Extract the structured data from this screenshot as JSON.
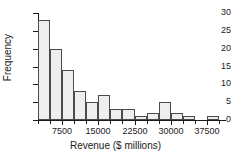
{
  "chart_data": {
    "type": "bar",
    "title": "",
    "xlabel": "Revenue ($ millions)",
    "ylabel": "Frequency",
    "grid": false,
    "legend": null,
    "xlim": [
      2500,
      41250
    ],
    "ylim": [
      0,
      30
    ],
    "bin_width": 2500,
    "xticks": [
      7500,
      15000,
      22500,
      30000,
      37500
    ],
    "xtick_labels": [
      "7500",
      "15000",
      "22500",
      "30000",
      "37500"
    ],
    "yticks": [
      0,
      5,
      10,
      15,
      20,
      25,
      30
    ],
    "ytick_labels": [
      "0",
      "5",
      "10",
      "15",
      "20",
      "25",
      "30"
    ],
    "bins": [
      {
        "left": 2500,
        "right": 5000,
        "center": 3750,
        "value": 28
      },
      {
        "left": 5000,
        "right": 7500,
        "center": 6250,
        "value": 20
      },
      {
        "left": 7500,
        "right": 10000,
        "center": 8750,
        "value": 14
      },
      {
        "left": 10000,
        "right": 12500,
        "center": 11250,
        "value": 8
      },
      {
        "left": 12500,
        "right": 15000,
        "center": 13750,
        "value": 5
      },
      {
        "left": 15000,
        "right": 17500,
        "center": 16250,
        "value": 7
      },
      {
        "left": 17500,
        "right": 20000,
        "center": 18750,
        "value": 3
      },
      {
        "left": 20000,
        "right": 22500,
        "center": 21250,
        "value": 3
      },
      {
        "left": 22500,
        "right": 25000,
        "center": 23750,
        "value": 1
      },
      {
        "left": 25000,
        "right": 27500,
        "center": 26250,
        "value": 2
      },
      {
        "left": 27500,
        "right": 30000,
        "center": 28750,
        "value": 5
      },
      {
        "left": 30000,
        "right": 32500,
        "center": 31250,
        "value": 2
      },
      {
        "left": 32500,
        "right": 35000,
        "center": 33750,
        "value": 1
      },
      {
        "left": 35000,
        "right": 37500,
        "center": 36250,
        "value": 0
      },
      {
        "left": 37500,
        "right": 40000,
        "center": 38750,
        "value": 1
      }
    ],
    "categories": [
      "3750",
      "6250",
      "8750",
      "11250",
      "13750",
      "16250",
      "18750",
      "21250",
      "23750",
      "26250",
      "28750",
      "31250",
      "33750",
      "36250",
      "38750"
    ],
    "values": [
      28,
      20,
      14,
      8,
      5,
      7,
      3,
      3,
      1,
      2,
      5,
      2,
      1,
      0,
      1
    ],
    "colors": {
      "bar_fill": "#eeeeee",
      "bar_edge": "#4a4a4a",
      "axis": "#1a1a1a",
      "text": "#1a1a1a",
      "background": "#ffffff"
    }
  }
}
